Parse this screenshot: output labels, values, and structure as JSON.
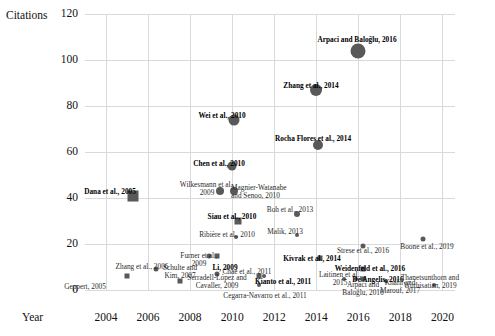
{
  "chart_data": {
    "type": "scatter",
    "title": "",
    "xlabel": "Year",
    "ylabel": "Citations",
    "xlim": [
      2003,
      2020.6
    ],
    "ylim": [
      0,
      120
    ],
    "grid": true,
    "legend": "none",
    "xticks": [
      2004,
      2006,
      2008,
      2010,
      2012,
      2014,
      2016,
      2018,
      2020
    ],
    "yticks": [
      0,
      20,
      40,
      60,
      80,
      100,
      120
    ],
    "marker_color": "#595959",
    "grid_color": "#d9d9d9",
    "points": [
      {
        "label": "Geppert, 2005",
        "x": 2005.0,
        "y": 6,
        "shape": "square",
        "size": 5,
        "lx": 85,
        "ly": 283,
        "align": "c",
        "bold": false
      },
      {
        "label": "Dana et al., 2005",
        "x": 2005.3,
        "y": 41,
        "shape": "square",
        "size": 11,
        "lx": 110,
        "ly": 188,
        "align": "c",
        "bold": true
      },
      {
        "label": "Zhang et al., 2006",
        "x": 2006.4,
        "y": 9,
        "shape": "circle",
        "size": 5,
        "lx": 142,
        "ly": 263,
        "align": "c",
        "bold": false
      },
      {
        "label": "Schulte and\nKim, 2007",
        "x": 2007.5,
        "y": 4,
        "shape": "square",
        "size": 5,
        "lx": 180,
        "ly": 264,
        "align": "c",
        "bold": false
      },
      {
        "label": "Furner et al.,\n2009",
        "x": 2008.9,
        "y": 15,
        "shape": "circle",
        "size": 5,
        "lx": 199,
        "ly": 252,
        "align": "c",
        "bold": false
      },
      {
        "label": "Li, 2009",
        "x": 2009.3,
        "y": 15,
        "shape": "square",
        "size": 5,
        "lx": 225,
        "ly": 264,
        "align": "c",
        "bold": true
      },
      {
        "label": "Serradell-López and\nCavaller, 2009",
        "x": 2009.3,
        "y": 7,
        "shape": "circle",
        "size": 5,
        "lx": 217,
        "ly": 274,
        "align": "c",
        "bold": false
      },
      {
        "label": "Wilkesmann et al.,\n2009",
        "x": 2009.4,
        "y": 43,
        "shape": "circle",
        "size": 8,
        "lx": 207,
        "ly": 181,
        "align": "c",
        "bold": false
      },
      {
        "label": "Wei et al., 2010",
        "x": 2010.1,
        "y": 74,
        "shape": "circle",
        "size": 11,
        "lx": 222,
        "ly": 112,
        "align": "c",
        "bold": true
      },
      {
        "label": "Chen et al., 2010",
        "x": 2010.0,
        "y": 54,
        "shape": "circle",
        "size": 9,
        "lx": 219,
        "ly": 160,
        "align": "c",
        "bold": true
      },
      {
        "label": "Magnier-Watanabe\nand Senoo, 2010",
        "x": 2010.1,
        "y": 43,
        "shape": "circle",
        "size": 8,
        "lx": 231,
        "ly": 184,
        "align": "l",
        "bold": false
      },
      {
        "label": "Siau et al., 2010",
        "x": 2010.3,
        "y": 30,
        "shape": "square",
        "size": 7,
        "lx": 232,
        "ly": 213,
        "align": "c",
        "bold": true
      },
      {
        "label": "Ribière et al., 2010",
        "x": 2010.2,
        "y": 23,
        "shape": "circle",
        "size": 4,
        "lx": 227,
        "ly": 231,
        "align": "c",
        "bold": false
      },
      {
        "label": "Chae et al., 2011",
        "x": 2011.5,
        "y": 6,
        "shape": "circle",
        "size": 4,
        "lx": 247,
        "ly": 268,
        "align": "c",
        "bold": false
      },
      {
        "label": "Kianto et al., 2011",
        "x": 2011.3,
        "y": 6,
        "shape": "square",
        "size": 5,
        "lx": 255,
        "ly": 278,
        "align": "l",
        "bold": true
      },
      {
        "label": "Cegarra-Navarro et al., 2011",
        "x": 2011.3,
        "y": 2,
        "shape": "circle",
        "size": 4,
        "lx": 265,
        "ly": 292,
        "align": "c",
        "bold": false
      },
      {
        "label": "Boh et al., 2013",
        "x": 2013.1,
        "y": 33,
        "shape": "circle",
        "size": 6,
        "lx": 290,
        "ly": 206,
        "align": "c",
        "bold": false
      },
      {
        "label": "Malik, 2013",
        "x": 2013.1,
        "y": 24,
        "shape": "circle",
        "size": 4,
        "lx": 285,
        "ly": 228,
        "align": "c",
        "bold": false
      },
      {
        "label": "Rocha Flores et al., 2014",
        "x": 2014.1,
        "y": 63,
        "shape": "circle",
        "size": 10,
        "lx": 313,
        "ly": 135,
        "align": "c",
        "bold": true
      },
      {
        "label": "Zhang et al., 2014",
        "x": 2014.0,
        "y": 87,
        "shape": "circle",
        "size": 12,
        "lx": 311,
        "ly": 82,
        "align": "c",
        "bold": true
      },
      {
        "label": "Kivrak et al., 2014",
        "x": 2014.2,
        "y": 14,
        "shape": "square",
        "size": 5,
        "lx": 312,
        "ly": 255,
        "align": "c",
        "bold": true
      },
      {
        "label": "Laitinen et al.,\n2015",
        "x": 2015.3,
        "y": 5,
        "shape": "circle",
        "size": 4,
        "lx": 340,
        "ly": 271,
        "align": "c",
        "bold": false
      },
      {
        "label": "Arpaci and\nBaloğlu, 2016",
        "x": 2015.9,
        "y": 5,
        "shape": "circle",
        "size": 4,
        "lx": 363,
        "ly": 281,
        "align": "c",
        "bold": false
      },
      {
        "label": "Arpaci and Baloğlu, 2016",
        "x": 2016.0,
        "y": 104,
        "shape": "circle",
        "size": 15,
        "lx": 357,
        "ly": 36,
        "align": "c",
        "bold": true
      },
      {
        "label": "Strese et al., 2016",
        "x": 2016.2,
        "y": 19,
        "shape": "circle",
        "size": 5,
        "lx": 363,
        "ly": 247,
        "align": "c",
        "bold": false
      },
      {
        "label": "Weidenfeld et al., 2016",
        "x": 2016.2,
        "y": 9,
        "shape": "square",
        "size": 5,
        "lx": 370,
        "ly": 265,
        "align": "c",
        "bold": true
      },
      {
        "label": "De Angelis, 2016",
        "x": 2016.2,
        "y": 5,
        "shape": "square",
        "size": 5,
        "lx": 378,
        "ly": 276,
        "align": "c",
        "bold": true
      },
      {
        "label": "Khalil and\nMarouf, 2017",
        "x": 2017.3,
        "y": 4,
        "shape": "circle",
        "size": 4,
        "lx": 400,
        "ly": 279,
        "align": "c",
        "bold": false
      },
      {
        "label": "Boone et al., 2019",
        "x": 2019.1,
        "y": 22,
        "shape": "circle",
        "size": 5,
        "lx": 427,
        "ly": 243,
        "align": "c",
        "bold": false
      },
      {
        "label": "Thanetsunthorn and\nWuthisatian, 2019",
        "x": 2019.6,
        "y": 2,
        "shape": "circle",
        "size": 4,
        "lx": 430,
        "ly": 274,
        "align": "c",
        "bold": false
      }
    ]
  },
  "axes": {
    "y_title": "Citations",
    "x_title": "Year"
  }
}
